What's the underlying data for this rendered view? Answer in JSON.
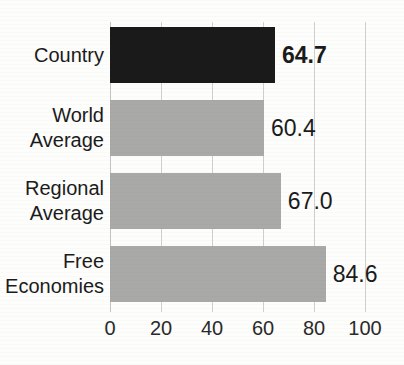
{
  "chart_data": {
    "type": "bar",
    "orientation": "horizontal",
    "title": "Index of Economic Freedom",
    "categories": [
      "Country",
      "World\nAverage",
      "Regional\nAverage",
      "Free\nEconomies"
    ],
    "values": [
      64.7,
      60.4,
      67.0,
      84.6
    ],
    "value_labels": [
      "64.7",
      "60.4",
      "67.0",
      "84.6"
    ],
    "highlighted_index": 0,
    "xlabel": "",
    "ylabel": "",
    "xlim": [
      0,
      100
    ],
    "xticks": [
      0,
      20,
      40,
      60,
      80,
      100
    ],
    "xtick_labels": [
      "0",
      "20",
      "40",
      "60",
      "80",
      "100"
    ],
    "grid": true,
    "grid_axis": "x",
    "legend": false,
    "bar_colors": [
      "#1a1a1a",
      "#a9a9a7",
      "#a9a9a7",
      "#a9a9a7"
    ],
    "series": [
      {
        "name": "Score",
        "points": [
          {
            "category": "Country",
            "label_lines": [
              "Country"
            ],
            "value": 64.7,
            "value_text": "64.7",
            "color": "#1a1a1a",
            "emphasis": "bold"
          },
          {
            "category": "World Average",
            "label_lines": [
              "World",
              "Average"
            ],
            "value": 60.4,
            "value_text": "60.4",
            "color": "#a9a9a7",
            "emphasis": "normal"
          },
          {
            "category": "Regional Average",
            "label_lines": [
              "Regional",
              "Average"
            ],
            "value": 67.0,
            "value_text": "67.0",
            "color": "#a9a9a7",
            "emphasis": "normal"
          },
          {
            "category": "Free Economies",
            "label_lines": [
              "Free",
              "Economies"
            ],
            "value": 84.6,
            "value_text": "84.6",
            "color": "#a9a9a7",
            "emphasis": "normal"
          }
        ]
      }
    ]
  },
  "colors": {
    "background": "#fdfdfc",
    "gridline": "#cfcfcd",
    "bar_dark": "#1a1a1a",
    "bar_grey": "#a9a9a7",
    "text": "#1b1b1b"
  }
}
